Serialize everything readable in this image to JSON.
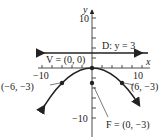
{
  "graph": {
    "axis_x_label": "x",
    "axis_y_label": "y",
    "tick_labels": {
      "x_neg": "−10",
      "x_pos": "10",
      "y_pos": "10",
      "y_neg": "−10"
    },
    "directrix_label": "D: y = 3",
    "vertex_label": "V = (0, 0)",
    "focus_label": "F = (0, −3)",
    "point_left_label": "(−6, −3)",
    "point_right_label": "(6, −3)",
    "equation": "x^2 = -12y",
    "colors": {
      "ink": "#222222",
      "background": "#ffffff"
    }
  }
}
